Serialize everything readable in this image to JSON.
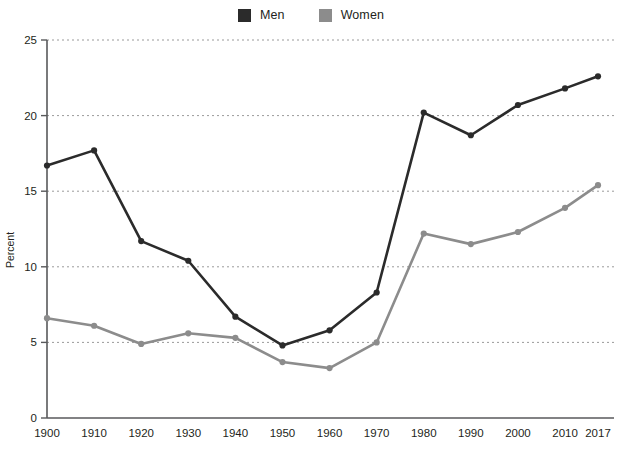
{
  "legend": {
    "position": "top-center",
    "entries": [
      {
        "label": "Men",
        "color": "#2b2b2b",
        "swatch": "square-swatch"
      },
      {
        "label": "Women",
        "color": "#8c8c8c",
        "swatch": "square-swatch"
      }
    ]
  },
  "axes": {
    "y_title": "Percent",
    "y_ticks": [
      "0",
      "5",
      "10",
      "15",
      "20",
      "25"
    ],
    "x_ticks": [
      "1900",
      "1910",
      "1920",
      "1930",
      "1940",
      "1950",
      "1960",
      "1970",
      "1980",
      "1990",
      "2000",
      "2010",
      "2017"
    ]
  },
  "chart_data": {
    "type": "line",
    "title": "",
    "subtitle": "",
    "xlabel": "",
    "ylabel": "Percent",
    "categories": [
      1900,
      1910,
      1920,
      1930,
      1940,
      1950,
      1960,
      1970,
      1980,
      1990,
      2000,
      2010,
      2017
    ],
    "xtick_labels": [
      "1900",
      "1910",
      "1920",
      "1930",
      "1940",
      "1950",
      "1960",
      "1970",
      "1980",
      "1990",
      "2000",
      "2010",
      "2017"
    ],
    "ylim": [
      0,
      25
    ],
    "yticks": [
      0,
      5,
      10,
      15,
      20,
      25
    ],
    "grid": "horizontal-dashed",
    "legend_position": "top-center",
    "markers": true,
    "series": [
      {
        "name": "Men",
        "color": "#2b2b2b",
        "values": [
          16.7,
          17.7,
          11.7,
          10.4,
          6.7,
          4.8,
          5.8,
          8.3,
          20.2,
          18.7,
          20.7,
          21.8,
          22.6
        ]
      },
      {
        "name": "Women",
        "color": "#8c8c8c",
        "values": [
          6.6,
          6.1,
          4.9,
          5.6,
          5.3,
          3.7,
          3.3,
          5.0,
          12.2,
          11.5,
          12.3,
          13.9,
          15.4
        ]
      }
    ]
  }
}
